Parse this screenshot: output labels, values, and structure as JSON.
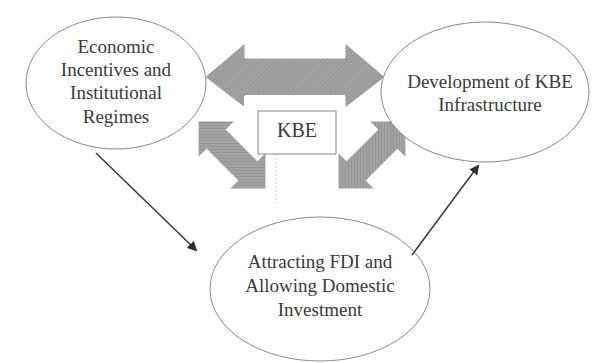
{
  "diagram": {
    "type": "conceptual-cycle",
    "central_node": {
      "label": "KBE"
    },
    "nodes": [
      {
        "id": "left",
        "lines": [
          "Economic",
          "Incentives and",
          "Institutional",
          "Regimes"
        ]
      },
      {
        "id": "right",
        "lines": [
          "Development of KBE",
          "Infrastructure"
        ]
      },
      {
        "id": "bottom",
        "lines": [
          "Attracting FDI and",
          "Allowing Domestic",
          "Investment"
        ]
      }
    ],
    "connectors": [
      {
        "from": "left",
        "to": "right",
        "style": "thick-hatched-double-arrow"
      },
      {
        "from": "KBE",
        "to": "left",
        "style": "thick-hatched-double-arrow-diagonal"
      },
      {
        "from": "KBE",
        "to": "right",
        "style": "thick-hatched-double-arrow-diagonal"
      },
      {
        "from": "left",
        "to": "bottom",
        "style": "thin-line-arrow"
      },
      {
        "from": "bottom",
        "to": "right",
        "style": "thin-line-arrow"
      }
    ],
    "colors": {
      "ellipse_stroke": "#8a8a8a",
      "arrow_fill": "#9a9a9a",
      "line_arrow": "#333333",
      "text": "#3a3a3a"
    }
  }
}
